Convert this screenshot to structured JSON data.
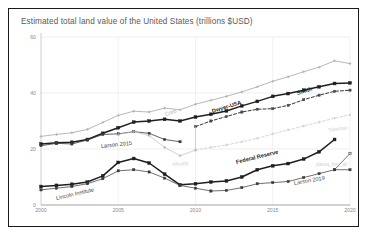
{
  "chart_data": {
    "type": "line",
    "title": "Estimated total land value of the United States (trillions $USD)",
    "xlabel": "",
    "ylabel": "",
    "xlim": [
      2000,
      2020
    ],
    "ylim": [
      0,
      60
    ],
    "yticks": [
      0,
      20,
      40,
      60
    ],
    "xticks": [
      2000,
      2005,
      2010,
      2015,
      2020
    ],
    "grid": true,
    "legend_position": "inline-annotations",
    "series": [
      {
        "name": "Corb",
        "label": "Corb",
        "color": "#9a9a9a",
        "style": "solid-light",
        "x": [
          2000,
          2001,
          2002,
          2003,
          2004,
          2005,
          2006,
          2007,
          2008,
          2009,
          2010,
          2011,
          2012,
          2013,
          2014,
          2015,
          2016,
          2017,
          2018,
          2019,
          2020
        ],
        "values": [
          24.5,
          25.2,
          25.8,
          27.0,
          29.5,
          32.0,
          33.5,
          33.2,
          34.6,
          34.0,
          36.0,
          37.4,
          38.8,
          40.4,
          42.2,
          44.2,
          45.8,
          47.6,
          49.2,
          51.5,
          50.5
        ]
      },
      {
        "name": "Dwyer-USA",
        "label": "Dwyer-USA",
        "color": "#1f1f1f",
        "style": "solid-bold",
        "x": [
          2000,
          2001,
          2002,
          2003,
          2004,
          2005,
          2006,
          2007,
          2008,
          2009,
          2010,
          2011,
          2012,
          2013,
          2014,
          2015,
          2016,
          2017,
          2018,
          2019,
          2020
        ],
        "values": [
          21.8,
          22.2,
          22.4,
          23.4,
          25.6,
          27.6,
          29.6,
          30.0,
          30.6,
          30.0,
          31.4,
          32.4,
          33.6,
          35.4,
          37.0,
          38.8,
          39.8,
          41.0,
          42.2,
          43.4,
          43.6
        ]
      },
      {
        "name": "Larson 2015",
        "label": "Larson 2015",
        "color": "#3a3a3a",
        "style": "solid",
        "x": [
          2000,
          2001,
          2002,
          2003,
          2004,
          2005,
          2006,
          2007,
          2008,
          2009
        ],
        "values": [
          21.2,
          22.0,
          21.8,
          23.2,
          25.2,
          25.4,
          26.2,
          25.6,
          23.4,
          22.6
        ]
      },
      {
        "name": "Smith",
        "label": "Smith",
        "color": "#1f1f1f",
        "style": "dashed",
        "x": [
          2010,
          2011,
          2012,
          2013,
          2014,
          2015,
          2016,
          2017,
          2018,
          2019,
          2020
        ],
        "values": [
          28.0,
          30.0,
          31.6,
          33.2,
          34.2,
          34.4,
          35.6,
          37.6,
          39.2,
          40.6,
          41.0
        ]
      },
      {
        "name": "Tideman",
        "label": "Tideman",
        "color": "#c4c4c4",
        "style": "dashed-light",
        "x": [
          2010,
          2011,
          2012,
          2013,
          2014,
          2015,
          2016,
          2017,
          2018,
          2019,
          2020
        ],
        "values": [
          19.6,
          20.6,
          21.4,
          22.6,
          23.8,
          25.4,
          26.8,
          28.2,
          29.6,
          31.0,
          32.2
        ]
      },
      {
        "name": "Allsopp",
        "label": "Allsopp",
        "color": "#bdbdbd",
        "style": "solid-light",
        "x": [
          2005,
          2006,
          2007,
          2008,
          2009,
          2010
        ],
        "values": [
          25.2,
          26.2,
          24.8,
          20.6,
          17.6,
          19.6
        ]
      },
      {
        "name": "Federal Reserve",
        "label": "Federal Reserve",
        "color": "#1f1f1f",
        "style": "solid-bold",
        "x": [
          2000,
          2001,
          2002,
          2003,
          2004,
          2005,
          2006,
          2007,
          2008,
          2009,
          2010,
          2011,
          2012,
          2013,
          2014,
          2015,
          2016,
          2017,
          2018,
          2019
        ],
        "values": [
          6.6,
          7.0,
          7.4,
          8.2,
          10.4,
          15.2,
          16.6,
          15.0,
          11.0,
          7.2,
          7.6,
          8.2,
          8.6,
          10.0,
          12.6,
          14.0,
          14.8,
          16.4,
          19.0,
          23.4
        ]
      },
      {
        "name": "Lincoln Institute",
        "label": "Lincoln Institute",
        "color": "#4a4a4a",
        "style": "solid",
        "x": [
          2000,
          2001,
          2002,
          2003,
          2004,
          2005,
          2006,
          2007,
          2008,
          2009,
          2010,
          2011,
          2012,
          2013,
          2014,
          2015,
          2016,
          2017,
          2018,
          2019,
          2020
        ],
        "values": [
          5.4,
          6.0,
          6.6,
          7.6,
          9.4,
          12.2,
          12.6,
          11.8,
          9.6,
          7.0,
          6.0,
          5.0,
          5.2,
          6.2,
          7.6,
          8.0,
          8.4,
          9.8,
          11.2,
          12.6,
          12.6
        ]
      },
      {
        "name": "Larson 2019",
        "label": "Larson 2019",
        "color": "#555555",
        "style": "solid",
        "x": [
          2019,
          2020
        ],
        "values": [
          12.6,
          18.4
        ]
      },
      {
        "name": "places_hwy_all",
        "label": "places_hwy_all",
        "color": "#c9c9c9",
        "style": "point",
        "x": [
          2020
        ],
        "values": [
          18.4
        ]
      }
    ],
    "annotations": [
      {
        "text": "Corb",
        "x": 2008.0,
        "y": 33.5,
        "rotation": -17,
        "color": "#adadad",
        "weight": "normal",
        "size": 5.4
      },
      {
        "text": "Dwyer-USA",
        "x": 2011.1,
        "y": 34.6,
        "rotation": -17,
        "color": "#1f1f1f",
        "weight": "bold",
        "size": 5.6
      },
      {
        "text": "Smith",
        "x": 2016.6,
        "y": 41.2,
        "rotation": -17,
        "color": "#1f1f1f",
        "weight": "bold",
        "size": 5.6
      },
      {
        "text": "Larson 2015",
        "x": 2003.9,
        "y": 22.2,
        "rotation": -6,
        "color": "#3a3a3a",
        "weight": "normal",
        "size": 5.6
      },
      {
        "text": "Allsopp",
        "x": 2008.5,
        "y": 15.6,
        "rotation": -5,
        "color": "#cfcfcf",
        "weight": "normal",
        "size": 5.0
      },
      {
        "text": "Tideman",
        "x": 2018.6,
        "y": 28.0,
        "rotation": -8,
        "color": "#cfcfcf",
        "weight": "normal",
        "size": 5.2
      },
      {
        "text": "Federal Reserve",
        "x": 2012.6,
        "y": 16.6,
        "rotation": -14,
        "color": "#1f1f1f",
        "weight": "bold",
        "size": 5.6
      },
      {
        "text": "Lincoln Institute",
        "x": 2001.0,
        "y": 3.6,
        "rotation": -13,
        "color": "#4a4a4a",
        "weight": "normal",
        "size": 5.6
      },
      {
        "text": "Larson 2019",
        "x": 2016.4,
        "y": 9.0,
        "rotation": -10,
        "color": "#4a4a4a",
        "weight": "normal",
        "size": 5.6
      },
      {
        "text": "places_hwy_all",
        "x": 2017.8,
        "y": 15.4,
        "rotation": 0,
        "color": "#cfcfcf",
        "weight": "normal",
        "size": 4.6
      }
    ]
  }
}
